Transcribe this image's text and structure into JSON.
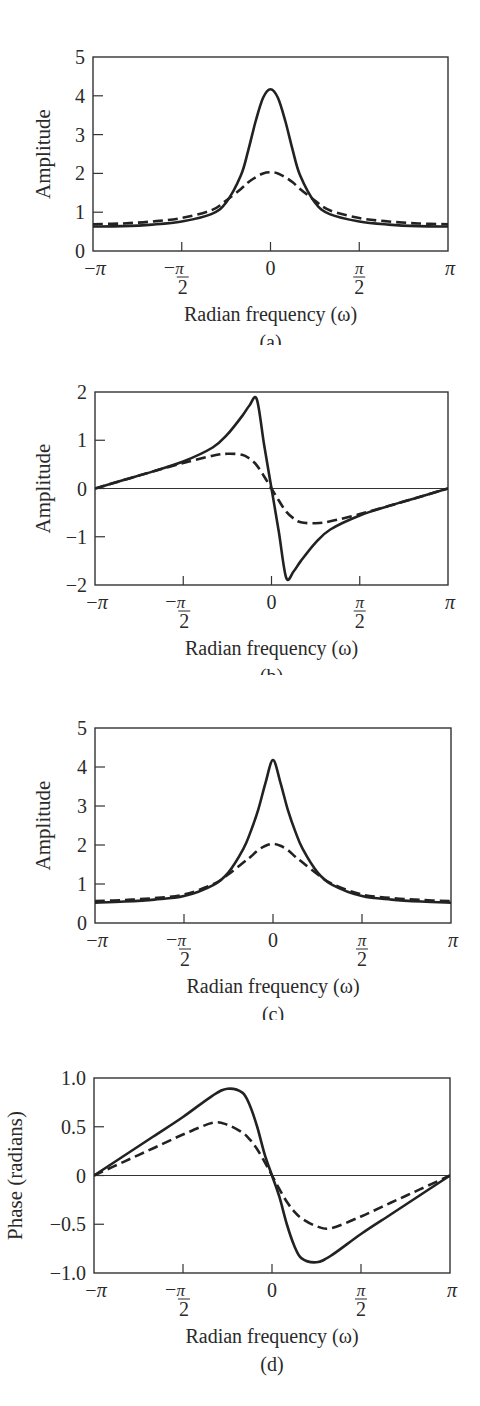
{
  "figure": {
    "panels": [
      {
        "id": "a",
        "caption": "(a)",
        "ylabel": "Amplitude",
        "xlabel": "Radian frequency (ω)"
      },
      {
        "id": "b",
        "caption": "(b)",
        "ylabel": "Amplitude",
        "xlabel": "Radian frequency (ω)"
      },
      {
        "id": "c",
        "caption": "(c)",
        "ylabel": "Amplitude",
        "xlabel": "Radian frequency (ω)"
      },
      {
        "id": "d",
        "caption": "(d)",
        "ylabel": "Phase (radians)",
        "xlabel": "Radian frequency (ω)"
      }
    ],
    "x_tick_labels": [
      "−π",
      "−π/2",
      "0",
      "π/2",
      "π"
    ],
    "line_color": "#222222"
  },
  "chart_data": [
    {
      "type": "line",
      "title": "(a)",
      "xlabel": "Radian frequency (ω)",
      "ylabel": "Amplitude",
      "xlim": [
        -3.1416,
        3.1416
      ],
      "ylim": [
        0,
        5
      ],
      "yticks": [
        0,
        1,
        2,
        3,
        4,
        5
      ],
      "xticks": [
        "-π",
        "-π/2",
        "0",
        "π/2",
        "π"
      ],
      "grid": false,
      "legend": null,
      "x": [
        -3.1416,
        -2.618,
        -2.0944,
        -1.5708,
        -1.0472,
        -0.7854,
        -0.5236,
        -0.3927,
        -0.2618,
        -0.1309,
        0,
        0.1309,
        0.2618,
        0.3927,
        0.5236,
        0.7854,
        1.0472,
        1.5708,
        2.0944,
        2.618,
        3.1416
      ],
      "series": [
        {
          "name": "solid",
          "style": "solid",
          "values": [
            0.63,
            0.64,
            0.68,
            0.76,
            0.95,
            1.25,
            1.95,
            2.6,
            3.35,
            3.95,
            4.17,
            3.95,
            3.35,
            2.6,
            1.95,
            1.25,
            0.95,
            0.76,
            0.68,
            0.64,
            0.63
          ]
        },
        {
          "name": "dashed",
          "style": "dashed",
          "values": [
            0.69,
            0.71,
            0.76,
            0.85,
            1.05,
            1.3,
            1.6,
            1.77,
            1.9,
            2.0,
            2.03,
            2.0,
            1.9,
            1.77,
            1.6,
            1.3,
            1.05,
            0.85,
            0.76,
            0.71,
            0.69
          ]
        }
      ]
    },
    {
      "type": "line",
      "title": "(b)",
      "xlabel": "Radian frequency (ω)",
      "ylabel": "Amplitude",
      "xlim": [
        -3.1416,
        3.1416
      ],
      "ylim": [
        -2,
        2
      ],
      "yticks": [
        -2,
        -1,
        0,
        1,
        2
      ],
      "xticks": [
        "-π",
        "-π/2",
        "0",
        "π/2",
        "π"
      ],
      "grid": false,
      "zero_line": true,
      "legend": null,
      "x": [
        -3.1416,
        -2.618,
        -2.0944,
        -1.5708,
        -1.0472,
        -0.7854,
        -0.5236,
        -0.3927,
        -0.2618,
        -0.1309,
        0,
        0.1309,
        0.2618,
        0.3927,
        0.5236,
        0.7854,
        1.0472,
        1.5708,
        2.0944,
        2.618,
        3.1416
      ],
      "series": [
        {
          "name": "solid",
          "style": "solid",
          "values": [
            0,
            0.18,
            0.36,
            0.56,
            0.85,
            1.12,
            1.5,
            1.72,
            1.85,
            0.9,
            0,
            -0.9,
            -1.85,
            -1.72,
            -1.5,
            -1.12,
            -0.85,
            -0.56,
            -0.36,
            -0.18,
            0
          ]
        },
        {
          "name": "dashed",
          "style": "dashed",
          "values": [
            0,
            0.18,
            0.36,
            0.53,
            0.68,
            0.72,
            0.7,
            0.62,
            0.48,
            0.25,
            0,
            -0.25,
            -0.48,
            -0.62,
            -0.7,
            -0.72,
            -0.68,
            -0.53,
            -0.36,
            -0.18,
            0
          ]
        }
      ]
    },
    {
      "type": "line",
      "title": "(c)",
      "xlabel": "Radian frequency (ω)",
      "ylabel": "Amplitude",
      "xlim": [
        -3.1416,
        3.1416
      ],
      "ylim": [
        0,
        5
      ],
      "yticks": [
        0,
        1,
        2,
        3,
        4,
        5
      ],
      "xticks": [
        "-π",
        "-π/2",
        "0",
        "π/2",
        "π"
      ],
      "grid": false,
      "legend": null,
      "x": [
        -3.1416,
        -2.618,
        -2.0944,
        -1.5708,
        -1.0472,
        -0.7854,
        -0.5236,
        -0.3927,
        -0.2618,
        -0.1309,
        0,
        0.1309,
        0.2618,
        0.3927,
        0.5236,
        0.7854,
        1.0472,
        1.5708,
        2.0944,
        2.618,
        3.1416
      ],
      "series": [
        {
          "name": "solid",
          "style": "solid",
          "values": [
            0.52,
            0.55,
            0.6,
            0.69,
            0.98,
            1.3,
            1.9,
            2.35,
            2.9,
            3.6,
            4.18,
            3.6,
            2.9,
            2.35,
            1.9,
            1.3,
            0.98,
            0.69,
            0.6,
            0.55,
            0.52
          ]
        },
        {
          "name": "dashed",
          "style": "dashed",
          "values": [
            0.56,
            0.59,
            0.64,
            0.73,
            1.0,
            1.25,
            1.55,
            1.7,
            1.87,
            1.98,
            2.03,
            1.98,
            1.87,
            1.7,
            1.55,
            1.25,
            1.0,
            0.73,
            0.64,
            0.59,
            0.56
          ]
        }
      ]
    },
    {
      "type": "line",
      "title": "(d)",
      "xlabel": "Radian frequency (ω)",
      "ylabel": "Phase (radians)",
      "xlim": [
        -3.1416,
        3.1416
      ],
      "ylim": [
        -1.0,
        1.0
      ],
      "yticks": [
        -1.0,
        -0.5,
        0,
        0.5,
        1.0
      ],
      "xticks": [
        "-π",
        "-π/2",
        "0",
        "π/2",
        "π"
      ],
      "grid": false,
      "zero_line": true,
      "legend": null,
      "x": [
        -3.1416,
        -2.618,
        -2.0944,
        -1.5708,
        -1.0472,
        -0.7854,
        -0.5236,
        -0.3927,
        -0.2618,
        -0.1309,
        0,
        0.1309,
        0.2618,
        0.3927,
        0.5236,
        0.7854,
        1.0472,
        1.5708,
        2.0944,
        2.618,
        3.1416
      ],
      "series": [
        {
          "name": "solid",
          "style": "solid",
          "values": [
            0,
            0.2,
            0.4,
            0.6,
            0.82,
            0.89,
            0.85,
            0.72,
            0.5,
            0.22,
            0,
            -0.22,
            -0.5,
            -0.72,
            -0.85,
            -0.89,
            -0.82,
            -0.6,
            -0.4,
            -0.2,
            0
          ]
        },
        {
          "name": "dashed",
          "style": "dashed",
          "values": [
            0,
            0.14,
            0.28,
            0.42,
            0.54,
            0.52,
            0.44,
            0.37,
            0.27,
            0.14,
            0,
            -0.14,
            -0.27,
            -0.37,
            -0.44,
            -0.52,
            -0.54,
            -0.42,
            -0.28,
            -0.14,
            0
          ]
        }
      ]
    }
  ]
}
